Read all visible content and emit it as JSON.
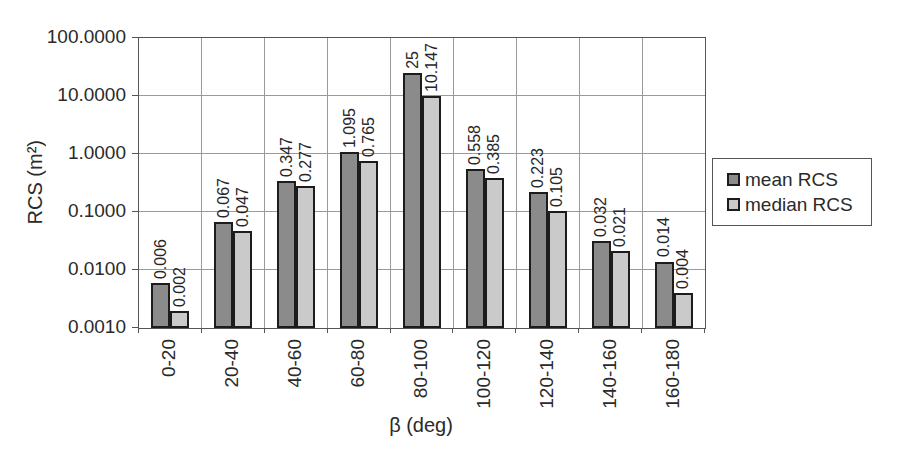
{
  "chart_data": {
    "type": "bar",
    "y_scale": "log",
    "ylim": [
      0.001,
      100
    ],
    "xlabel": "β (deg)",
    "ylabel": "RCS (m²)",
    "grid": true,
    "legend_position": "right",
    "y_tick_labels": [
      "100.0000",
      "10.0000",
      "1.0000",
      "0.1000",
      "0.0100",
      "0.0010"
    ],
    "categories": [
      "0-20",
      "20-40",
      "40-60",
      "60-80",
      "80-100",
      "100-120",
      "120-140",
      "140-160",
      "160-180"
    ],
    "series": [
      {
        "name": "mean RCS",
        "color": "#8b8b8b",
        "values": [
          0.006,
          0.067,
          0.347,
          1.095,
          25,
          0.558,
          0.223,
          0.032,
          0.014
        ],
        "value_labels": [
          "0.006",
          "0.067",
          "0.347",
          "1.095",
          "25",
          "0.558",
          "0.223",
          "0.032",
          "0.014"
        ]
      },
      {
        "name": "median RCS",
        "color": "#cacaca",
        "values": [
          0.002,
          0.047,
          0.277,
          0.765,
          10.147,
          0.385,
          0.105,
          0.021,
          0.004
        ],
        "value_labels": [
          "0.002",
          "0.047",
          "0.277",
          "0.765",
          "10.147",
          "0.385",
          "0.105",
          "0.021",
          "0.004"
        ]
      }
    ]
  },
  "colors": {
    "background": "#ffffff",
    "gridline": "#9a9a9a",
    "plot_border": "#555555",
    "bar_border": "#1c1c1c",
    "text": "#2a2a2a"
  }
}
